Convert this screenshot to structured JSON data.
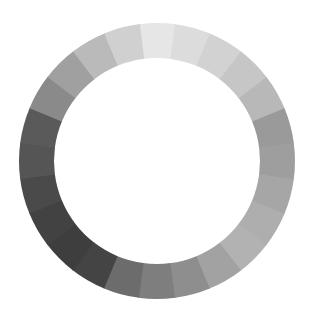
{
  "diagram": {
    "type": "grayscale-color-wheel",
    "title": "",
    "center": {
      "x": 157,
      "y": 161
    },
    "outer_radius": 138,
    "inner_radius": 103,
    "segment_count": 24,
    "start_angle_deg": -7.5,
    "background": "#ffffff",
    "segments": [
      {
        "index": 0,
        "color": "#e6e6e6"
      },
      {
        "index": 1,
        "color": "#dcdcdc"
      },
      {
        "index": 2,
        "color": "#d2d2d2"
      },
      {
        "index": 3,
        "color": "#c6c6c6"
      },
      {
        "index": 4,
        "color": "#b8b8b8"
      },
      {
        "index": 5,
        "color": "#9a9a9a"
      },
      {
        "index": 6,
        "color": "#9e9e9e"
      },
      {
        "index": 7,
        "color": "#a6a6a6"
      },
      {
        "index": 8,
        "color": "#aeaeae"
      },
      {
        "index": 9,
        "color": "#b2b2b2"
      },
      {
        "index": 10,
        "color": "#a2a2a2"
      },
      {
        "index": 11,
        "color": "#8e8e8e"
      },
      {
        "index": 12,
        "color": "#7e7e7e"
      },
      {
        "index": 13,
        "color": "#6c6c6c"
      },
      {
        "index": 14,
        "color": "#444444"
      },
      {
        "index": 15,
        "color": "#3e3e3e"
      },
      {
        "index": 16,
        "color": "#424242"
      },
      {
        "index": 17,
        "color": "#4a4a4a"
      },
      {
        "index": 18,
        "color": "#555555"
      },
      {
        "index": 19,
        "color": "#5a5a5a"
      },
      {
        "index": 20,
        "color": "#8a8a8a"
      },
      {
        "index": 21,
        "color": "#a0a0a0"
      },
      {
        "index": 22,
        "color": "#bababa"
      },
      {
        "index": 23,
        "color": "#d0d0d0"
      }
    ]
  }
}
